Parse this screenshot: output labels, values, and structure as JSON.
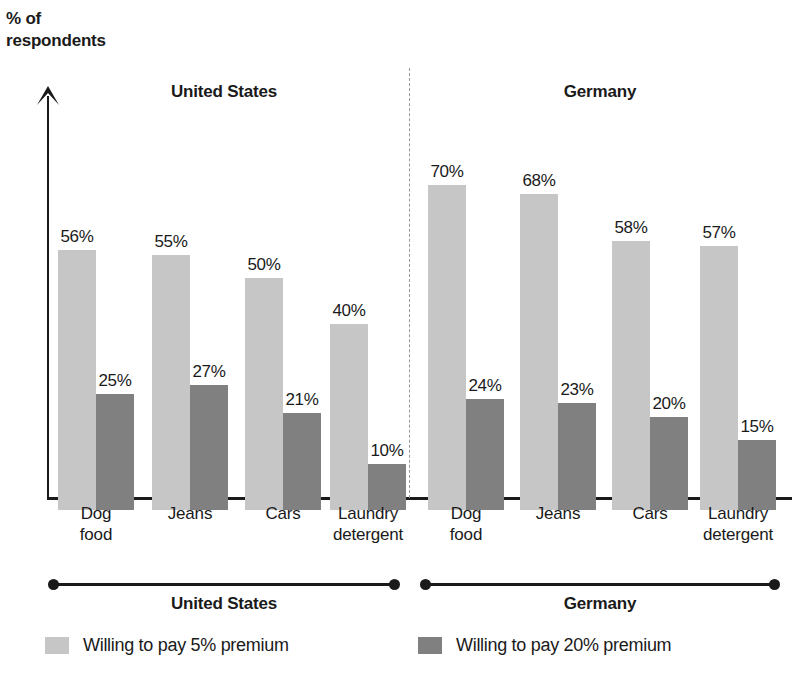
{
  "axis_label": "% of\nrespondents",
  "axis_label_line1": "% of",
  "axis_label_line2": "respondents",
  "panels": [
    {
      "title": "United States",
      "bracket_title": "United States"
    },
    {
      "title": "Germany",
      "bracket_title": "Germany"
    }
  ],
  "legend": [
    {
      "label": "Willing to pay 5% premium",
      "color": "#c6c6c6",
      "swatch": "light"
    },
    {
      "label": "Willing to pay 20% premium",
      "color": "#808080",
      "swatch": "dark"
    }
  ],
  "categories_display": [
    {
      "line1": "Dog",
      "line2": "food"
    },
    {
      "line1": "Jeans",
      "line2": ""
    },
    {
      "line1": "Cars",
      "line2": ""
    },
    {
      "line1": "Laundry",
      "line2": "detergent"
    }
  ],
  "us": {
    "values_5": [
      "56%",
      "55%",
      "50%",
      "40%"
    ],
    "values_20": [
      "25%",
      "27%",
      "21%",
      "10%"
    ]
  },
  "de": {
    "values_5": [
      "70%",
      "68%",
      "58%",
      "57%"
    ],
    "values_20": [
      "24%",
      "23%",
      "20%",
      "15%"
    ]
  },
  "chart_data": {
    "type": "bar",
    "title": "",
    "ylabel": "% of respondents",
    "xlabel": "",
    "ylim": [
      0,
      75
    ],
    "grid": false,
    "legend_position": "bottom",
    "panels": [
      {
        "name": "United States",
        "categories": [
          "Dog food",
          "Jeans",
          "Cars",
          "Laundry detergent"
        ],
        "series": [
          {
            "name": "Willing to pay 5% premium",
            "color": "#c6c6c6",
            "values": [
              56,
              55,
              50,
              40
            ]
          },
          {
            "name": "Willing to pay 20% premium",
            "color": "#808080",
            "values": [
              25,
              27,
              21,
              10
            ]
          }
        ]
      },
      {
        "name": "Germany",
        "categories": [
          "Dog food",
          "Jeans",
          "Cars",
          "Laundry detergent"
        ],
        "series": [
          {
            "name": "Willing to pay 5% premium",
            "color": "#c6c6c6",
            "values": [
              70,
              68,
              58,
              57
            ]
          },
          {
            "name": "Willing to pay 20% premium",
            "color": "#808080",
            "values": [
              24,
              23,
              20,
              15
            ]
          }
        ]
      }
    ],
    "annotations": [
      "All bars are labelled with their value as a percentage.",
      "A dashed vertical line separates the United States panel from the Germany panel."
    ]
  },
  "layout": {
    "baseline_y": 497,
    "px_per_percent": 4.64,
    "bar_width": 38,
    "group_starts_us": [
      58,
      152,
      245,
      330
    ],
    "group_starts_de": [
      428,
      520,
      612,
      700
    ]
  }
}
